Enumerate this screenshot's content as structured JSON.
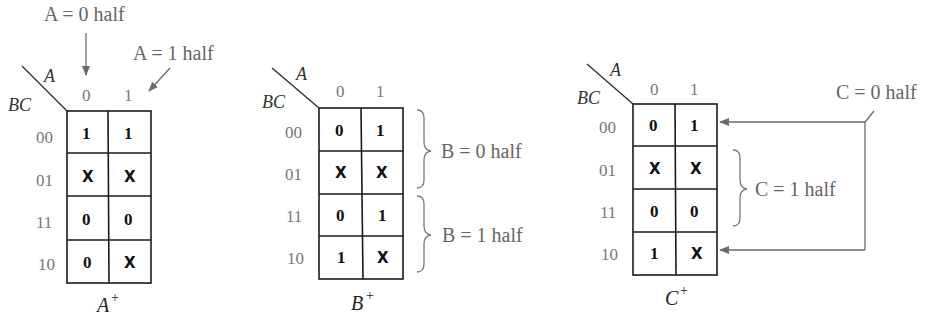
{
  "maps": [
    {
      "id": "a",
      "title": "A",
      "title_sup": "+",
      "row_var": "BC",
      "col_var": "A",
      "col_labels": [
        "0",
        "1"
      ],
      "row_labels": [
        "00",
        "01",
        "11",
        "10"
      ],
      "cells": [
        [
          "1",
          "1"
        ],
        [
          "X",
          "X"
        ],
        [
          "0",
          "0"
        ],
        [
          "0",
          "X"
        ]
      ]
    },
    {
      "id": "b",
      "title": "B",
      "title_sup": "+",
      "row_var": "BC",
      "col_var": "A",
      "col_labels": [
        "0",
        "1"
      ],
      "row_labels": [
        "00",
        "01",
        "11",
        "10"
      ],
      "cells": [
        [
          "0",
          "1"
        ],
        [
          "X",
          "X"
        ],
        [
          "0",
          "1"
        ],
        [
          "1",
          "X"
        ]
      ]
    },
    {
      "id": "c",
      "title": "C",
      "title_sup": "+",
      "row_var": "BC",
      "col_var": "A",
      "col_labels": [
        "0",
        "1"
      ],
      "row_labels": [
        "00",
        "01",
        "11",
        "10"
      ],
      "cells": [
        [
          "0",
          "1"
        ],
        [
          "X",
          "X"
        ],
        [
          "0",
          "0"
        ],
        [
          "1",
          "X"
        ]
      ]
    }
  ],
  "annotations": {
    "a_zero_half": "A = 0 half",
    "a_one_half": "A = 1 half",
    "b_zero_half": "B = 0 half",
    "b_one_half": "B = 1 half",
    "c_zero_half": "C = 0 half",
    "c_one_half": "C = 1 half"
  }
}
